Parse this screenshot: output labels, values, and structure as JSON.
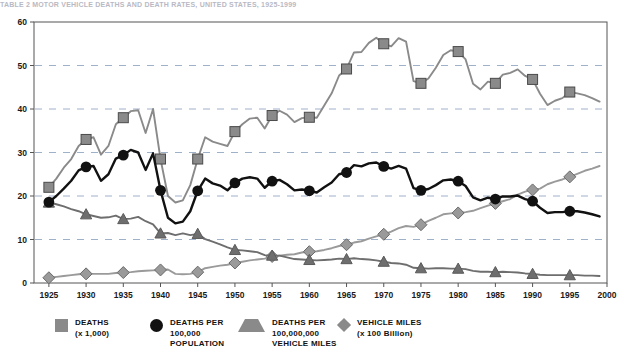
{
  "title": "TABLE 2  MOTOR VEHICLE DEATHS AND DEATH RATES, UNITED STATES, 1925-1999",
  "chart_data": {
    "type": "line",
    "title": "",
    "xlabel": "",
    "ylabel": "",
    "xlim": [
      1923,
      2000
    ],
    "ylim": [
      0,
      60
    ],
    "grid": true,
    "grid_values": [
      10,
      20,
      30,
      40,
      50
    ],
    "legend_position": "bottom",
    "x_ticks": [
      "1925",
      "1930",
      "1935",
      "1940",
      "1945",
      "1950",
      "1955",
      "1960",
      "1965",
      "1970",
      "1975",
      "1980",
      "1985",
      "1990",
      "1995",
      "2000"
    ],
    "y_ticks": [
      "0",
      "10",
      "20",
      "30",
      "40",
      "50",
      "60"
    ],
    "x": [
      1925,
      1926,
      1927,
      1928,
      1929,
      1930,
      1931,
      1932,
      1933,
      1934,
      1935,
      1936,
      1937,
      1938,
      1939,
      1940,
      1941,
      1942,
      1943,
      1944,
      1945,
      1946,
      1947,
      1948,
      1949,
      1950,
      1951,
      1952,
      1953,
      1954,
      1955,
      1956,
      1957,
      1958,
      1959,
      1960,
      1961,
      1962,
      1963,
      1964,
      1965,
      1966,
      1967,
      1968,
      1969,
      1970,
      1971,
      1972,
      1973,
      1974,
      1975,
      1976,
      1977,
      1978,
      1979,
      1980,
      1981,
      1982,
      1983,
      1984,
      1985,
      1986,
      1987,
      1988,
      1989,
      1990,
      1991,
      1992,
      1993,
      1994,
      1995,
      1996,
      1997,
      1998,
      1999
    ],
    "series": [
      {
        "name": "DEATHS (x 1,000)",
        "marker": "square",
        "color": "#8a8a8a",
        "marker_years": [
          1925,
          1930,
          1935,
          1940,
          1945,
          1950,
          1955,
          1960,
          1965,
          1970,
          1975,
          1980,
          1985,
          1990,
          1995
        ],
        "values": [
          22.0,
          24.0,
          26.5,
          28.5,
          31.5,
          33.0,
          33.5,
          29.5,
          31.5,
          36.5,
          38.0,
          39.5,
          39.7,
          34.5,
          40.0,
          28.5,
          20.0,
          18.5,
          19.0,
          22.5,
          28.5,
          33.5,
          32.5,
          32.0,
          31.5,
          34.8,
          36.5,
          37.8,
          38.0,
          35.5,
          38.5,
          39.6,
          38.7,
          37.0,
          37.9,
          38.1,
          38.0,
          40.8,
          43.6,
          47.7,
          49.2,
          53.0,
          53.1,
          55.2,
          56.4,
          55.0,
          54.4,
          56.3,
          55.5,
          46.4,
          45.9,
          47.0,
          49.5,
          52.4,
          53.5,
          53.2,
          51.4,
          45.8,
          44.5,
          46.3,
          45.9,
          47.9,
          48.3,
          49.1,
          47.6,
          46.8,
          43.5,
          40.9,
          41.9,
          42.5,
          43.9,
          43.6,
          43.2,
          42.5,
          41.7
        ]
      },
      {
        "name": "DEATHS PER 100,000 POPULATION",
        "marker": "circle",
        "color": "#111111",
        "marker_years": [
          1925,
          1930,
          1935,
          1940,
          1945,
          1950,
          1955,
          1960,
          1965,
          1970,
          1975,
          1980,
          1985,
          1990,
          1995
        ],
        "values": [
          18.6,
          20.0,
          21.7,
          23.5,
          25.9,
          26.7,
          26.9,
          23.5,
          25.0,
          28.6,
          29.4,
          30.6,
          30.0,
          26.0,
          29.8,
          21.3,
          15.0,
          13.7,
          14.1,
          16.5,
          21.2,
          24.0,
          22.9,
          22.4,
          21.3,
          23.0,
          24.0,
          24.3,
          24.0,
          21.9,
          23.4,
          23.7,
          22.7,
          21.3,
          21.5,
          21.2,
          20.8,
          22.0,
          23.1,
          25.0,
          25.4,
          27.1,
          26.8,
          27.5,
          27.7,
          26.8,
          26.3,
          26.9,
          26.3,
          21.8,
          21.3,
          21.6,
          22.5,
          23.6,
          23.8,
          23.4,
          22.3,
          19.7,
          19.0,
          19.6,
          19.3,
          19.9,
          19.9,
          20.1,
          19.3,
          18.8,
          17.3,
          16.1,
          16.3,
          16.3,
          16.5,
          16.5,
          16.2,
          15.8,
          15.3
        ]
      },
      {
        "name": "DEATHS PER 100,000,000 VEHICLE MILES",
        "marker": "triangle",
        "color": "#6e6e6e",
        "marker_years": [
          1925,
          1930,
          1935,
          1940,
          1945,
          1950,
          1955,
          1960,
          1965,
          1970,
          1975,
          1980,
          1985,
          1990,
          1995
        ],
        "values": [
          18.5,
          18.1,
          17.6,
          17.0,
          16.5,
          15.8,
          15.4,
          15.0,
          15.1,
          15.5,
          14.7,
          14.8,
          15.2,
          14.2,
          13.5,
          11.4,
          11.5,
          11.0,
          11.4,
          11.0,
          11.3,
          10.1,
          9.5,
          8.9,
          8.2,
          7.6,
          7.5,
          7.3,
          7.1,
          6.4,
          6.3,
          6.3,
          5.9,
          5.5,
          5.4,
          5.3,
          5.2,
          5.3,
          5.4,
          5.6,
          5.5,
          5.7,
          5.5,
          5.4,
          5.2,
          4.9,
          4.6,
          4.5,
          4.2,
          3.5,
          3.4,
          3.3,
          3.4,
          3.4,
          3.3,
          3.3,
          3.2,
          2.8,
          2.6,
          2.6,
          2.5,
          2.6,
          2.5,
          2.4,
          2.2,
          2.1,
          1.9,
          1.8,
          1.8,
          1.8,
          1.8,
          1.8,
          1.7,
          1.7,
          1.6
        ]
      },
      {
        "name": "VEHICLE MILES (x 100 Billion)",
        "marker": "diamond",
        "color": "#9a9a9a",
        "marker_years": [
          1925,
          1930,
          1935,
          1940,
          1945,
          1950,
          1955,
          1960,
          1965,
          1970,
          1975,
          1980,
          1985,
          1990,
          1995
        ],
        "values": [
          1.2,
          1.4,
          1.6,
          1.8,
          2.0,
          2.1,
          2.1,
          2.1,
          2.1,
          2.3,
          2.4,
          2.5,
          2.7,
          2.8,
          2.9,
          3.0,
          3.1,
          2.1,
          2.0,
          2.1,
          2.5,
          3.4,
          3.7,
          4.0,
          4.2,
          4.6,
          4.9,
          5.2,
          5.4,
          5.6,
          6.1,
          6.3,
          6.5,
          6.6,
          7.0,
          7.2,
          7.3,
          7.6,
          8.0,
          8.5,
          8.8,
          9.3,
          9.6,
          10.2,
          10.7,
          11.2,
          11.8,
          12.6,
          13.1,
          12.9,
          13.4,
          14.3,
          15.0,
          15.8,
          16.0,
          16.1,
          16.3,
          16.6,
          17.2,
          17.8,
          18.3,
          18.8,
          19.3,
          20.3,
          21.0,
          21.4,
          21.7,
          22.7,
          23.3,
          23.8,
          24.4,
          25.1,
          25.8,
          26.3,
          26.9
        ]
      }
    ]
  },
  "legend": [
    {
      "label": "DEATHS",
      "sub": "(x 1,000)",
      "sub2": "",
      "marker": "square-marker"
    },
    {
      "label": "DEATHS PER",
      "sub": "100,000",
      "sub2": "POPULATION",
      "marker": "circle-marker"
    },
    {
      "label": "DEATHS PER",
      "sub": "100,000,000",
      "sub2": "VEHICLE MILES",
      "marker": "triangle-marker"
    },
    {
      "label": "VEHICLE MILES",
      "sub": "(x 100 Billion)",
      "sub2": "",
      "marker": "diamond-marker"
    }
  ]
}
